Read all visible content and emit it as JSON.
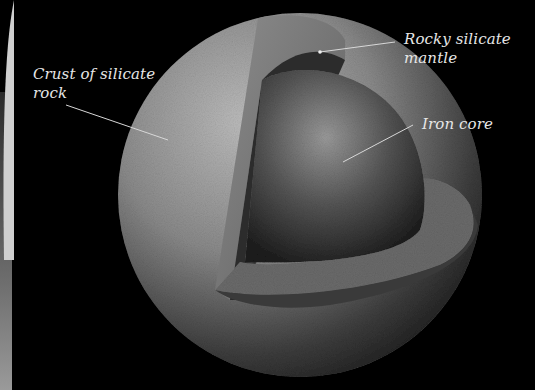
{
  "figure": {
    "background_color": "#000000",
    "labels": [
      {
        "id": "crust",
        "text": "Crust of silicate\nrock"
      },
      {
        "id": "mantle",
        "text": "Rocky silicate\nmantle"
      },
      {
        "id": "core",
        "text": "Iron core"
      }
    ],
    "layers": [
      {
        "name": "crust",
        "color": "#9a9a9a"
      },
      {
        "name": "mantle",
        "color": "#6e6e6e"
      },
      {
        "name": "core",
        "color": "#4a4a4a"
      }
    ]
  }
}
